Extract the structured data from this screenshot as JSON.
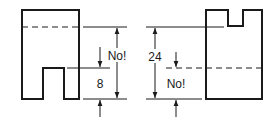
{
  "diagram": {
    "left_figure": {
      "dimension_label": "8",
      "warning_label": "No!"
    },
    "right_figure": {
      "dimension_label": "24",
      "warning_label": "No!"
    },
    "colors": {
      "stroke": "#1a1a1a",
      "background": "#ffffff"
    }
  }
}
